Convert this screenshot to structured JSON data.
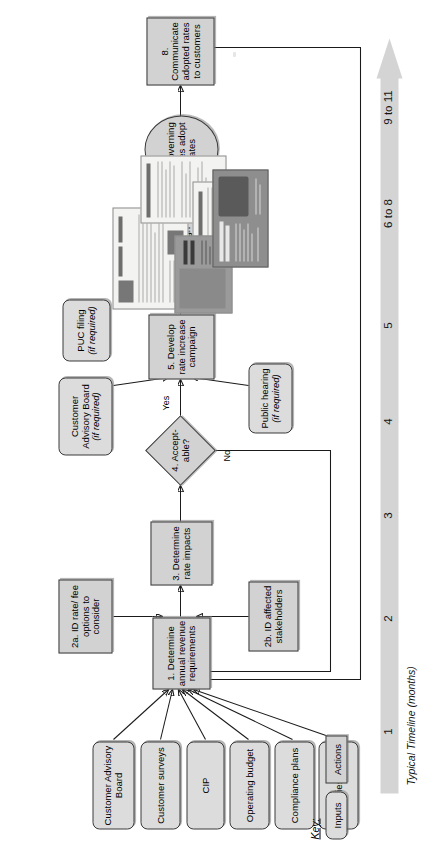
{
  "diagram": {
    "orientation": "rotated-90-ccw",
    "colors": {
      "action_fill": "#d2d2d2",
      "input_fill": "#dcdcdc",
      "timeline_fill": "#d4d4d4",
      "stroke": "#3a3a3a"
    }
  },
  "inputs": [
    {
      "id": "in-cab",
      "label": "Customer Advisory Board"
    },
    {
      "id": "in-surveys",
      "label": "Customer surveys"
    },
    {
      "id": "in-cip",
      "label": "CIP"
    },
    {
      "id": "in-opbudget",
      "label": "Operating budget"
    },
    {
      "id": "in-compliance",
      "label": "Compliance plans"
    },
    {
      "id": "in-facilities",
      "label": "Facilities plans"
    }
  ],
  "steps": [
    {
      "id": "step-1",
      "label": "1. Determine annual revenue requirements",
      "shape": "rect"
    },
    {
      "id": "step-2a",
      "label": "2a. ID rate/ fee options to consider",
      "shape": "rect"
    },
    {
      "id": "step-2b",
      "label": "2b. ID affected stakeholders",
      "shape": "rect"
    },
    {
      "id": "step-3",
      "label": "3. Determine rate impacts",
      "shape": "rect"
    },
    {
      "id": "step-4",
      "label": "4. Accept- able?",
      "shape": "diamond"
    },
    {
      "id": "step-5",
      "label": "5. Develop rate increase campaign",
      "shape": "rect"
    },
    {
      "id": "step-6",
      "label": "6. Implement campaign",
      "shape": "rect"
    },
    {
      "id": "step-7",
      "label": "7. Governing bodies adopt rates",
      "shape": "ellipse"
    },
    {
      "id": "step-8",
      "label": "8. Communicate adopted rates to customers",
      "shape": "rect"
    }
  ],
  "optional_nodes": [
    {
      "id": "opt-cab",
      "line1": "Customer Advisory Board",
      "line2": "(if required)"
    },
    {
      "id": "opt-hearing",
      "line1": "Public hearing",
      "line2": "(if required)"
    },
    {
      "id": "opt-puc",
      "line1": "PUC filing",
      "line2": "(if required)"
    }
  ],
  "edge_labels": {
    "yes": "Yes",
    "no": "No"
  },
  "timeline": {
    "caption": "Typical Timeline (months)",
    "ticks": [
      "1",
      "2",
      "3",
      "4",
      "5",
      "6 to 8",
      "9 to 11"
    ]
  },
  "key": {
    "title": "Key:",
    "inputs_label": "Inputs",
    "actions_label": "Actions"
  }
}
